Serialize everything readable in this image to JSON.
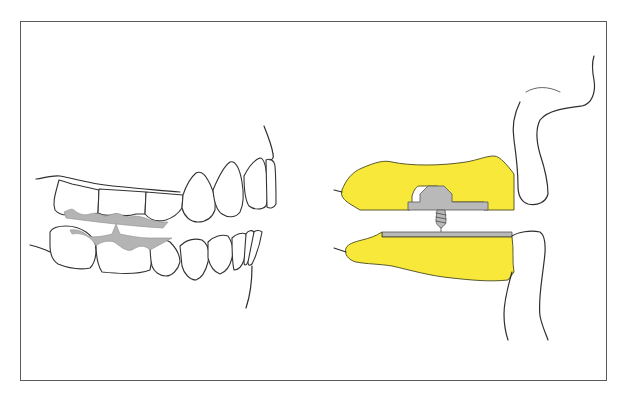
{
  "figure": {
    "colors": {
      "frame_border": "#5a5a5a",
      "outline": "#2e2e2e",
      "occlusal_contact_grey": "#b4b4b4",
      "wax_rim_yellow": "#f7e83a",
      "metal_grey": "#b9b9b9",
      "background": "#ffffff"
    },
    "panels": [
      {
        "id": "dentition-lateral-view",
        "label": ""
      },
      {
        "id": "occlusion-rims-section",
        "label": ""
      }
    ]
  }
}
